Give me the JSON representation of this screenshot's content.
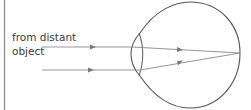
{
  "diagram": {
    "type": "eye-ray-diagram",
    "label_lines": [
      "from distant",
      "object"
    ],
    "colors": {
      "outline": "#555555",
      "ray": "#8a8a8a",
      "border": "#8c8c8c",
      "text": "#3a3a3a"
    },
    "rays": [
      {
        "name": "upper-ray",
        "incoming_y": 47,
        "focus": [
          240,
          53
        ]
      },
      {
        "name": "lower-ray",
        "incoming_y": 70,
        "focus": [
          240,
          53
        ]
      }
    ]
  }
}
